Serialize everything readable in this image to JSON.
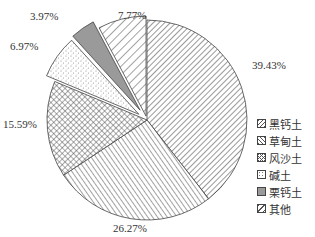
{
  "chart_data": {
    "type": "pie",
    "title": "",
    "categories": [
      "黑钙土",
      "草甸土",
      "风沙土",
      "碱土",
      "栗钙土",
      "其他"
    ],
    "values": [
      39.43,
      26.27,
      15.59,
      6.97,
      3.97,
      7.77
    ],
    "labels": [
      "39.43%",
      "26.27%",
      "15.59%",
      "6.97%",
      "3.97%",
      "7.77%"
    ],
    "start_angle": "12 o'clock, clockwise",
    "exploded": [
      "碱土",
      "栗钙土",
      "其他"
    ],
    "patterns": [
      "diagonal-hatch-fine",
      "diagonal-hatch-back",
      "crosshatch",
      "dots",
      "solid-gray",
      "diagonal-hatch-wide"
    ],
    "legend_position": "right"
  },
  "legend": {
    "items": [
      {
        "label": "黑钙土",
        "pattern": "diag"
      },
      {
        "label": "草甸土",
        "pattern": "backdiag"
      },
      {
        "label": "风沙土",
        "pattern": "cross"
      },
      {
        "label": "碱土",
        "pattern": "dots"
      },
      {
        "label": "栗钙土",
        "pattern": "gray"
      },
      {
        "label": "其他",
        "pattern": "diag-wide"
      }
    ]
  },
  "colors": {
    "line": "#444444",
    "gray_fill": "#9a9a9a",
    "text": "#333333"
  }
}
